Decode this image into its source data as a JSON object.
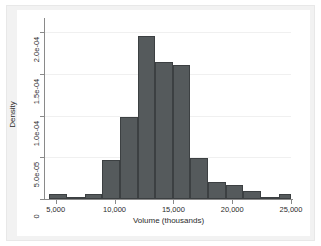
{
  "chart_data": {
    "type": "bar",
    "subtype": "histogram",
    "title": "",
    "xlabel": "Volume (thousands)",
    "ylabel": "Density",
    "xlim": [
      4000,
      25000
    ],
    "ylim": [
      0,
      0.000215
    ],
    "grid": true,
    "legend": null,
    "bin_width": 1500,
    "x_tick_labels": [
      "5,000",
      "10,000",
      "15,000",
      "20,000",
      "25,000"
    ],
    "x_tick_values": [
      5000,
      10000,
      15000,
      20000,
      25000
    ],
    "y_tick_labels": [
      "0",
      "5.0e-05",
      "1.0e-04",
      "1.5e-04",
      "2.0e-04"
    ],
    "y_tick_values": [
      0,
      5e-05,
      0.0001,
      0.00015,
      0.0002
    ],
    "bins": [
      {
        "x0": 4450,
        "x1": 5950,
        "density": 6e-06
      },
      {
        "x0": 5950,
        "x1": 7450,
        "density": 2.2e-06
      },
      {
        "x0": 7450,
        "x1": 8950,
        "density": 5.8e-06
      },
      {
        "x0": 8950,
        "x1": 10450,
        "density": 4.63e-05
      },
      {
        "x0": 10450,
        "x1": 11950,
        "density": 9.8e-05
      },
      {
        "x0": 11950,
        "x1": 13450,
        "density": 0.000196
      },
      {
        "x0": 13450,
        "x1": 14950,
        "density": 0.000164
      },
      {
        "x0": 14950,
        "x1": 16450,
        "density": 0.000161
      },
      {
        "x0": 16450,
        "x1": 17950,
        "density": 4.87e-05
      },
      {
        "x0": 17950,
        "x1": 19450,
        "density": 2e-05
      },
      {
        "x0": 19450,
        "x1": 20950,
        "density": 1.65e-05
      },
      {
        "x0": 20950,
        "x1": 22450,
        "density": 9.5e-06
      },
      {
        "x0": 22450,
        "x1": 23950,
        "density": 2e-06
      },
      {
        "x0": 23950,
        "x1": 25450,
        "density": 6e-06
      },
      {
        "x0": 25450,
        "x1": 26950,
        "density": 8e-07
      },
      {
        "x0": 26950,
        "x1": 28450,
        "density": 2.2e-06
      }
    ],
    "colors": {
      "bar_fill": "#555a5c",
      "bar_border": "#3c4042",
      "plot_background": "#ffffff",
      "graph_background": "#f2f2f2",
      "gridline": "#f0f0f0",
      "axis": "#8a8a8a",
      "text": "#2b2b2b"
    }
  }
}
